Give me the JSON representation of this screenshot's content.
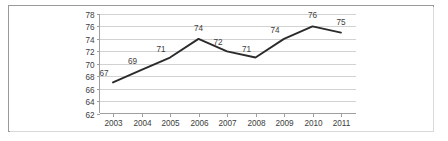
{
  "figure": {
    "border_color": "#9a9a9a",
    "background_color": "#ffffff"
  },
  "chart_data": {
    "type": "line",
    "title": "",
    "subtitle": "",
    "xlabel": "",
    "ylabel": "",
    "categories": [
      "2003",
      "2004",
      "2005",
      "2006",
      "2007",
      "2008",
      "2009",
      "2010",
      "2011"
    ],
    "values": [
      67,
      69,
      71,
      74,
      72,
      71,
      74,
      76,
      75
    ],
    "point_labels": [
      "67",
      "69",
      "71",
      "74",
      "72",
      "71",
      "74",
      "76",
      "75"
    ],
    "series": [
      {
        "name": "",
        "values": [
          67,
          69,
          71,
          74,
          72,
          71,
          74,
          76,
          75
        ],
        "color": "#2b2b2b"
      }
    ],
    "ylim": [
      62,
      78
    ],
    "ytick_step": 2,
    "ytick_labels": [
      "62",
      "64",
      "66",
      "68",
      "70",
      "72",
      "74",
      "76",
      "78"
    ],
    "xtick_labels": [
      "2003",
      "2004",
      "2005",
      "2006",
      "2007",
      "2008",
      "2009",
      "2010",
      "2011"
    ],
    "grid": {
      "horizontal": true,
      "vertical": false,
      "color": "#d2d2d2"
    },
    "legend": {
      "visible": false,
      "position": "none",
      "entries": []
    },
    "markers": false,
    "data_labels_visible": true,
    "axis_color": "#9f9f9f",
    "label_color": "#3d3d3d"
  }
}
